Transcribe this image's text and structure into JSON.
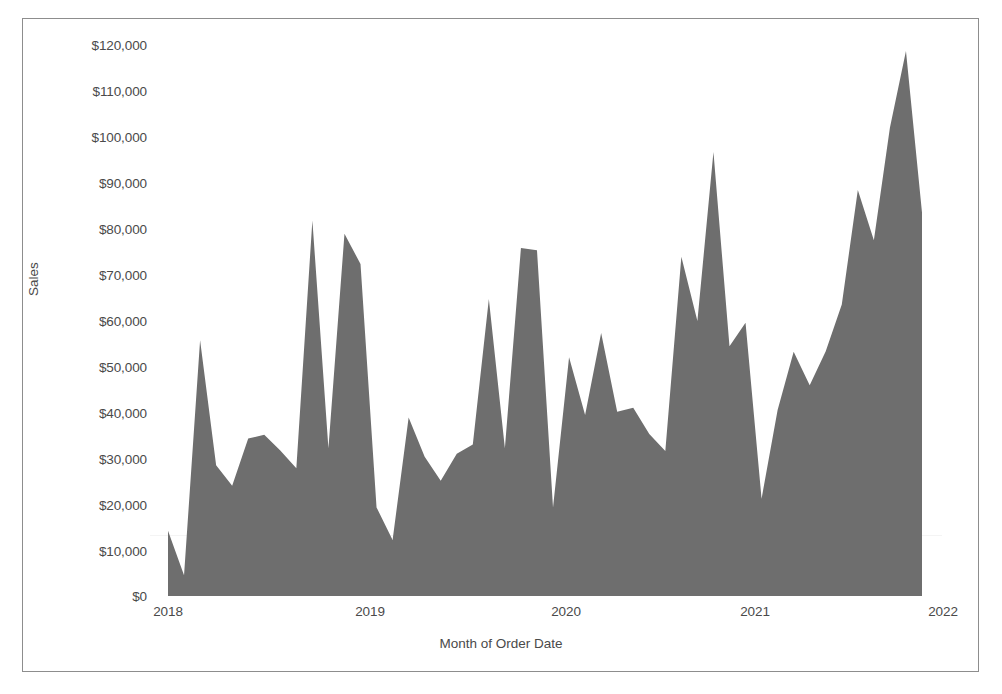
{
  "axes": {
    "y_title": "Sales",
    "x_title": "Month of Order Date",
    "y_ticks": [
      "$0",
      "$10,000",
      "$20,000",
      "$30,000",
      "$40,000",
      "$50,000",
      "$60,000",
      "$70,000",
      "$80,000",
      "$90,000",
      "$100,000",
      "$110,000",
      "$120,000"
    ],
    "x_ticks": [
      "2018",
      "2019",
      "2020",
      "2021",
      "2022"
    ]
  },
  "colors": {
    "area_fill": "#6e6e6e",
    "frame": "#8d8d8d",
    "text": "#4a4a4a",
    "background": "#ffffff"
  },
  "chart_data": {
    "type": "area",
    "title": "",
    "subtitle": "",
    "xlabel": "Month of Order Date",
    "ylabel": "Sales",
    "ylim": [
      0,
      125000
    ],
    "xlim": [
      "2018-01",
      "2021-12"
    ],
    "grid": false,
    "legend": null,
    "y_tick_values": [
      0,
      10000,
      20000,
      30000,
      40000,
      50000,
      60000,
      70000,
      80000,
      90000,
      100000,
      110000,
      120000
    ],
    "y_tick_labels": [
      "$0",
      "$10,000",
      "$20,000",
      "$30,000",
      "$40,000",
      "$50,000",
      "$60,000",
      "$70,000",
      "$80,000",
      "$90,000",
      "$100,000",
      "$110,000",
      "$120,000"
    ],
    "x_tick_values": [
      "2018",
      "2019",
      "2020",
      "2021",
      "2022"
    ],
    "x_tick_labels": [
      "2018",
      "2019",
      "2020",
      "2021",
      "2022"
    ],
    "x": [
      "2018-01",
      "2018-02",
      "2018-03",
      "2018-04",
      "2018-05",
      "2018-06",
      "2018-07",
      "2018-08",
      "2018-09",
      "2018-10",
      "2018-11",
      "2018-12",
      "2019-01",
      "2019-02",
      "2019-03",
      "2019-04",
      "2019-05",
      "2019-06",
      "2019-07",
      "2019-08",
      "2019-09",
      "2019-10",
      "2019-11",
      "2019-12",
      "2020-01",
      "2020-02",
      "2020-03",
      "2020-04",
      "2020-05",
      "2020-06",
      "2020-07",
      "2020-08",
      "2020-09",
      "2020-10",
      "2020-11",
      "2020-12",
      "2021-01",
      "2021-02",
      "2021-03",
      "2021-04",
      "2021-05",
      "2021-06",
      "2021-07",
      "2021-08",
      "2021-09",
      "2021-10",
      "2021-11",
      "2021-12"
    ],
    "categories": [
      "Jan 2018",
      "Feb 2018",
      "Mar 2018",
      "Apr 2018",
      "May 2018",
      "Jun 2018",
      "Jul 2018",
      "Aug 2018",
      "Sep 2018",
      "Oct 2018",
      "Nov 2018",
      "Dec 2018",
      "Jan 2019",
      "Feb 2019",
      "Mar 2019",
      "Apr 2019",
      "May 2019",
      "Jun 2019",
      "Jul 2019",
      "Aug 2019",
      "Sep 2019",
      "Oct 2019",
      "Nov 2019",
      "Dec 2019",
      "Jan 2020",
      "Feb 2020",
      "Mar 2020",
      "Apr 2020",
      "May 2020",
      "Jun 2020",
      "Jul 2020",
      "Aug 2020",
      "Sep 2020",
      "Oct 2020",
      "Nov 2020",
      "Dec 2020",
      "Jan 2021",
      "Feb 2021",
      "Mar 2021",
      "Apr 2021",
      "May 2021",
      "Jun 2021",
      "Jul 2021",
      "Aug 2021",
      "Sep 2021",
      "Oct 2021",
      "Nov 2021",
      "Dec 2021"
    ],
    "series": [
      {
        "name": "Sales",
        "values": [
          14200,
          4500,
          55700,
          28500,
          24000,
          34300,
          35100,
          31700,
          27800,
          81800,
          32200,
          78900,
          72300,
          19300,
          12200,
          38900,
          30300,
          25100,
          31000,
          33000,
          64700,
          32200,
          75800,
          75300,
          19300,
          52000,
          39400,
          57300,
          40100,
          41000,
          35300,
          31600,
          73900,
          59900,
          96700,
          54400,
          59500,
          21200,
          40500,
          53200,
          45900,
          53300,
          63500,
          88400,
          77500,
          102000,
          118700,
          83500
        ]
      }
    ]
  }
}
